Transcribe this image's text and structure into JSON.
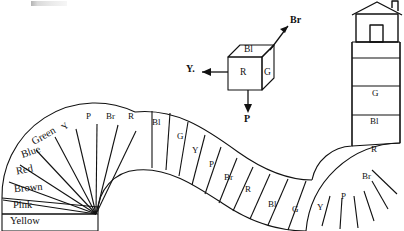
{
  "figure": {
    "type": "board-game-path-diagram"
  },
  "track": {
    "start_label": "Yellow",
    "named_segments": [
      {
        "label": "Yellow",
        "index": 1
      },
      {
        "label": "Pink",
        "index": 2
      },
      {
        "label": "Brown",
        "index": 3
      },
      {
        "label": "Red",
        "index": 4
      },
      {
        "label": "Blue",
        "index": 5
      },
      {
        "label": "Green",
        "index": 6
      }
    ],
    "abbrev_segments": [
      {
        "label": "Y",
        "index": 7
      },
      {
        "label": "P",
        "index": 8
      },
      {
        "label": "Br",
        "index": 9
      },
      {
        "label": "R",
        "index": 10
      },
      {
        "label": "Bl",
        "index": 11
      },
      {
        "label": "G",
        "index": 12
      },
      {
        "label": "Y",
        "index": 13
      },
      {
        "label": "P",
        "index": 14
      },
      {
        "label": "Br",
        "index": 15
      },
      {
        "label": "R",
        "index": 16
      },
      {
        "label": "Bl",
        "index": 17
      },
      {
        "label": "G",
        "index": 18
      },
      {
        "label": "Y",
        "index": 19
      },
      {
        "label": "P",
        "index": 20
      },
      {
        "label": "Br",
        "index": 21
      },
      {
        "label": "R",
        "index": 22
      },
      {
        "label": "Bl",
        "index": 23
      },
      {
        "label": "G",
        "index": 24
      }
    ],
    "destination": "house"
  },
  "cube": {
    "faces": {
      "top": "Bl",
      "front": "R",
      "right": "G"
    },
    "arrows": [
      {
        "label": "Br",
        "direction": "up-right"
      },
      {
        "label": "Y.",
        "direction": "left"
      },
      {
        "label": "P",
        "direction": "down"
      }
    ]
  },
  "colors": {
    "ink": "#111111",
    "paper": "#ffffff"
  }
}
